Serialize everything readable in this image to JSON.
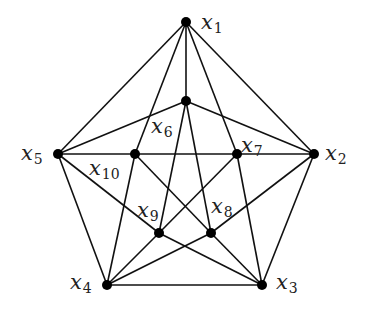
{
  "diagram": {
    "type": "graph",
    "stroke_color": "#111111",
    "node_color": "#000000",
    "nodes": [
      {
        "id": "x1",
        "base": "x",
        "sub": "1",
        "cx": 186,
        "cy": 22,
        "lx": 201,
        "ly": 12
      },
      {
        "id": "x2",
        "base": "x",
        "sub": "2",
        "cx": 314,
        "cy": 154,
        "lx": 325,
        "ly": 143
      },
      {
        "id": "x3",
        "base": "x",
        "sub": "3",
        "cx": 262,
        "cy": 285,
        "lx": 276,
        "ly": 272
      },
      {
        "id": "x4",
        "base": "x",
        "sub": "4",
        "cx": 107,
        "cy": 285,
        "lx": 70,
        "ly": 272
      },
      {
        "id": "x5",
        "base": "x",
        "sub": "5",
        "cx": 58,
        "cy": 154,
        "lx": 21,
        "ly": 143
      },
      {
        "id": "x6",
        "base": "x",
        "sub": "6",
        "cx": 186,
        "cy": 101,
        "lx": 151,
        "ly": 116
      },
      {
        "id": "x7",
        "base": "x",
        "sub": "7",
        "cx": 237,
        "cy": 154,
        "lx": 241,
        "ly": 135
      },
      {
        "id": "x8",
        "base": "x",
        "sub": "8",
        "cx": 211,
        "cy": 233,
        "lx": 211,
        "ly": 196
      },
      {
        "id": "x9",
        "base": "x",
        "sub": "9",
        "cx": 159,
        "cy": 233,
        "lx": 137,
        "ly": 200
      },
      {
        "id": "x10",
        "base": "x",
        "sub": "10",
        "cx": 135,
        "cy": 154,
        "lx": 89,
        "ly": 158
      }
    ],
    "edges": [
      [
        "x1",
        "x2"
      ],
      [
        "x2",
        "x3"
      ],
      [
        "x3",
        "x4"
      ],
      [
        "x4",
        "x5"
      ],
      [
        "x5",
        "x1"
      ],
      [
        "x1",
        "x10"
      ],
      [
        "x1",
        "x6"
      ],
      [
        "x1",
        "x7"
      ],
      [
        "x6",
        "x5"
      ],
      [
        "x6",
        "x2"
      ],
      [
        "x6",
        "x9"
      ],
      [
        "x6",
        "x8"
      ],
      [
        "x5",
        "x10"
      ],
      [
        "x10",
        "x7"
      ],
      [
        "x7",
        "x2"
      ],
      [
        "x10",
        "x4"
      ],
      [
        "x10",
        "x8"
      ],
      [
        "x8",
        "x3"
      ],
      [
        "x7",
        "x3"
      ],
      [
        "x7",
        "x9"
      ],
      [
        "x9",
        "x4"
      ],
      [
        "x5",
        "x9"
      ],
      [
        "x9",
        "x3"
      ],
      [
        "x2",
        "x8"
      ],
      [
        "x8",
        "x4"
      ]
    ]
  }
}
